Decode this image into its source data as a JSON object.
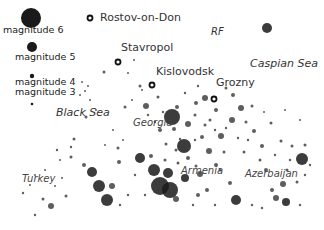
{
  "legend": {
    "items": [
      {
        "label": "magnitude 6",
        "x": 31,
        "y": 18,
        "r": 10,
        "lx": 3,
        "ly": 30
      },
      {
        "label": "magnitude 5",
        "x": 32,
        "y": 47,
        "r": 5,
        "lx": 15,
        "ly": 57
      },
      {
        "label": "magnitude 4",
        "x": 32,
        "y": 76,
        "r": 2.2,
        "lx": 15,
        "ly": 82
      },
      {
        "label": "magnitude 3",
        "x": 32,
        "y": 104,
        "r": 1.3,
        "lx": 15,
        "ly": 92
      }
    ]
  },
  "cities": [
    {
      "name": "Rostov-on-Don",
      "x": 90,
      "y": 18,
      "lx": 100,
      "ly": 18
    },
    {
      "name": "Stavropol",
      "x": 118,
      "y": 62,
      "lx": 121,
      "ly": 48
    },
    {
      "name": "Kislovodsk",
      "x": 152,
      "y": 85,
      "lx": 156,
      "ly": 72
    },
    {
      "name": "Grozny",
      "x": 214,
      "y": 99,
      "lx": 216,
      "ly": 83
    }
  ],
  "regions": [
    {
      "name": "RF",
      "x": 211,
      "y": 33,
      "class": "rf"
    },
    {
      "name": "Caspian Sea",
      "x": 250,
      "y": 64,
      "class": "sea"
    },
    {
      "name": "Black Sea",
      "x": 56,
      "y": 113,
      "class": "sea"
    },
    {
      "name": "Georgia",
      "x": 133,
      "y": 124,
      "class": "country"
    },
    {
      "name": "Armenia",
      "x": 181,
      "y": 172,
      "class": "country"
    },
    {
      "name": "Azerbaijan",
      "x": 245,
      "y": 175,
      "class": "country"
    },
    {
      "name": "Turkey",
      "x": 22,
      "y": 180,
      "class": "country"
    }
  ],
  "events": [
    [
      267,
      28,
      5
    ],
    [
      172,
      117,
      8
    ],
    [
      184,
      146,
      7
    ],
    [
      209,
      151,
      3
    ],
    [
      146,
      106,
      3
    ],
    [
      140,
      158,
      5
    ],
    [
      119,
      162,
      2
    ],
    [
      92,
      172,
      5
    ],
    [
      99,
      186,
      6
    ],
    [
      112,
      186,
      3
    ],
    [
      107,
      200,
      6
    ],
    [
      154,
      170,
      6
    ],
    [
      168,
      173,
      5
    ],
    [
      160,
      186,
      9
    ],
    [
      170,
      190,
      8
    ],
    [
      185,
      178,
      4
    ],
    [
      200,
      174,
      3
    ],
    [
      176,
      199,
      3
    ],
    [
      198,
      195,
      2
    ],
    [
      236,
      200,
      5
    ],
    [
      276,
      198,
      3
    ],
    [
      286,
      202,
      4
    ],
    [
      272,
      190,
      2
    ],
    [
      283,
      184,
      3
    ],
    [
      302,
      159,
      6
    ],
    [
      188,
      124,
      3
    ],
    [
      174,
      129,
      2
    ],
    [
      202,
      137,
      2
    ],
    [
      160,
      130,
      2
    ],
    [
      151,
      156,
      2
    ],
    [
      177,
      107,
      2
    ],
    [
      232,
      120,
      3
    ],
    [
      221,
      136,
      3
    ],
    [
      241,
      108,
      3
    ],
    [
      233,
      95,
      2
    ],
    [
      205,
      98,
      3
    ],
    [
      196,
      103,
      2
    ],
    [
      216,
      110,
      2
    ],
    [
      254,
      131,
      2
    ],
    [
      262,
      146,
      2
    ],
    [
      266,
      170,
      2
    ],
    [
      230,
      183,
      2
    ],
    [
      216,
      165,
      2
    ],
    [
      207,
      190,
      2
    ],
    [
      188,
      158,
      2
    ],
    [
      84,
      165,
      2
    ],
    [
      71,
      157,
      1.5
    ],
    [
      51,
      206,
      3
    ],
    [
      43,
      199,
      1.5
    ],
    [
      66,
      196,
      1.5
    ],
    [
      118,
      148,
      1.5
    ],
    [
      125,
      107,
      1.5
    ],
    [
      140,
      86,
      1.5
    ],
    [
      104,
      72,
      1.5
    ],
    [
      86,
      117,
      1.5
    ],
    [
      74,
      139,
      1.5
    ],
    [
      71,
      147,
      1.2
    ],
    [
      57,
      150,
      1.2
    ],
    [
      23,
      193,
      1.2
    ],
    [
      35,
      215,
      1.2
    ],
    [
      297,
      182,
      1.5
    ],
    [
      287,
      170,
      1.5
    ],
    [
      252,
      106,
      1.5
    ],
    [
      246,
      122,
      1.5
    ],
    [
      271,
      123,
      1.5
    ],
    [
      281,
      141,
      1.5
    ],
    [
      292,
      146,
      1.5
    ],
    [
      305,
      145,
      1.5
    ],
    [
      260,
      160,
      1.5
    ],
    [
      244,
      152,
      1.5
    ],
    [
      224,
      152,
      1.5
    ],
    [
      220,
      170,
      1.5
    ],
    [
      196,
      166,
      1.5
    ],
    [
      176,
      150,
      1.5
    ],
    [
      166,
      144,
      1.5
    ],
    [
      158,
      97,
      1.5
    ],
    [
      185,
      93,
      1.2
    ],
    [
      198,
      86,
      1.2
    ],
    [
      226,
      88,
      1.5
    ],
    [
      210,
      120,
      1.5
    ],
    [
      82,
      82,
      1
    ],
    [
      88,
      86,
      1
    ],
    [
      85,
      91,
      1
    ],
    [
      80,
      95,
      1
    ],
    [
      90,
      100,
      1
    ],
    [
      96,
      110,
      1
    ],
    [
      128,
      73,
      1
    ],
    [
      134,
      60,
      1
    ],
    [
      142,
      90,
      1
    ],
    [
      132,
      100,
      1
    ],
    [
      113,
      130,
      1
    ],
    [
      123,
      140,
      1
    ],
    [
      105,
      145,
      1
    ],
    [
      135,
      175,
      1.2
    ],
    [
      145,
      195,
      1.2
    ],
    [
      128,
      195,
      1.2
    ],
    [
      120,
      205,
      1.2
    ],
    [
      193,
      205,
      1.2
    ],
    [
      215,
      205,
      1.2
    ],
    [
      252,
      205,
      1.2
    ],
    [
      262,
      208,
      1.2
    ],
    [
      300,
      205,
      1.2
    ],
    [
      305,
      175,
      1.2
    ],
    [
      310,
      165,
      1.2
    ],
    [
      300,
      120,
      1
    ],
    [
      285,
      110,
      1
    ],
    [
      264,
      112,
      1
    ],
    [
      60,
      160,
      1
    ],
    [
      45,
      170,
      1
    ],
    [
      35,
      175,
      1
    ],
    [
      30,
      185,
      1
    ],
    [
      55,
      186,
      1
    ],
    [
      62,
      178,
      1
    ],
    [
      148,
      115,
      1.2
    ],
    [
      155,
      122,
      1.2
    ],
    [
      163,
      112,
      1.2
    ],
    [
      195,
      115,
      1.5
    ],
    [
      205,
      125,
      1.5
    ],
    [
      215,
      130,
      1.2
    ],
    [
      226,
      128,
      1.2
    ],
    [
      238,
      138,
      1.2
    ],
    [
      248,
      140,
      1.2
    ],
    [
      275,
      155,
      1.2
    ],
    [
      290,
      160,
      1.2
    ],
    [
      180,
      139,
      1.2
    ],
    [
      195,
      140,
      1.2
    ],
    [
      165,
      160,
      1.5
    ],
    [
      178,
      163,
      1.5
    ]
  ],
  "colors": {
    "background": "#ffffff",
    "event": "#1a1a1a",
    "city_marker": "#111111",
    "label": "#333333"
  }
}
